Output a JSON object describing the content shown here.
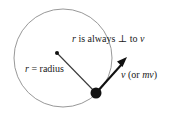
{
  "figure": {
    "labels": {
      "perpendicular_note_pre": "r",
      "perpendicular_note_mid": " is always ",
      "perpendicular_symbol": "⊥",
      "perpendicular_note_post": " to ",
      "perpendicular_note_var": "v",
      "radius_var": "r",
      "radius_equals": " = ",
      "radius_word": "radius",
      "velocity_var": "v",
      "velocity_paren_open": " (or ",
      "velocity_momentum": "mv",
      "velocity_paren_close": ")"
    },
    "colors": {
      "circle_stroke": "#8c8c8c",
      "radius_line": "#3a3a3a",
      "vector_arrow": "#111111",
      "point_mass": "#111111",
      "center_dot": "#111111",
      "text": "#1a1a1a",
      "background": "#ffffff"
    },
    "geometry": {
      "circle_center_x": 63,
      "circle_center_y": 58,
      "circle_radius": 49,
      "center_dot_x": 57,
      "center_dot_y": 53,
      "center_dot_r": 2,
      "point_mass_x": 96,
      "point_mass_y": 93,
      "point_mass_r": 5.5,
      "vector_tip_x": 127,
      "vector_tip_y": 58
    }
  }
}
